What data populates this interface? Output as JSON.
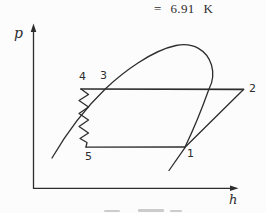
{
  "equation": "= 6.91 K",
  "axes": {
    "y_label": "p",
    "x_label": "h"
  },
  "points": {
    "p1": "1",
    "p2": "2",
    "p3": "3",
    "p4": "4",
    "p5": "5"
  },
  "colors": {
    "ink": "#2d2d2d",
    "paper": "#fcfcfc"
  },
  "diagram": {
    "type": "pressure-enthalpy refrigeration cycle sketch",
    "elements": [
      "vertical p-axis with up arrow",
      "horizontal h-axis with right arrow",
      "saturation dome curve",
      "condenser line 4-3-2",
      "zigzag expansion line 4-5",
      "evaporator line 5-1",
      "compression line 1-2"
    ]
  }
}
